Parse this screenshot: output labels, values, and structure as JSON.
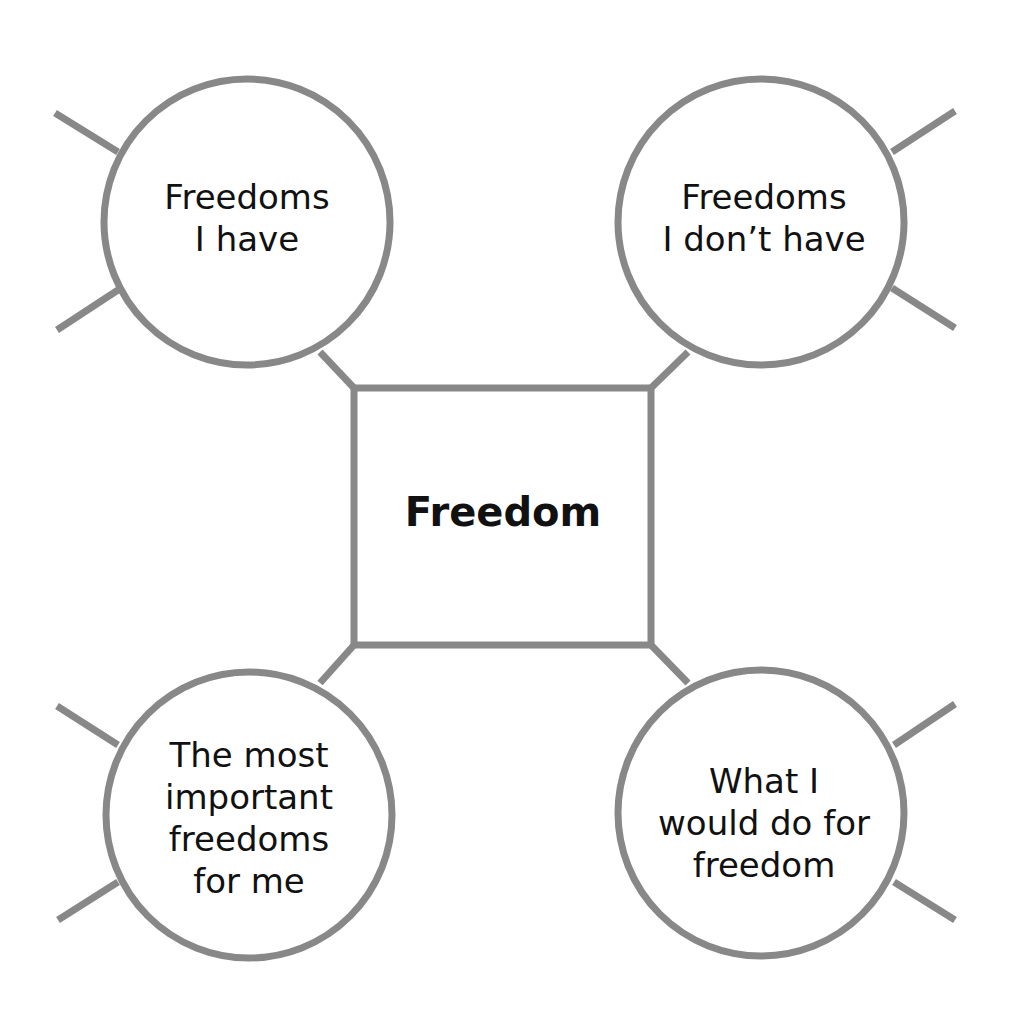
{
  "diagram": {
    "center": {
      "label": "Freedom"
    },
    "nodes": [
      {
        "id": "top-left",
        "label": "Freedoms\nI have"
      },
      {
        "id": "top-right",
        "label": "Freedoms\nI don’t have"
      },
      {
        "id": "bottom-left",
        "label": "The most\nimportant\nfreedoms\nfor me"
      },
      {
        "id": "bottom-right",
        "label": "What I\nwould do for\nfreedom"
      }
    ],
    "colors": {
      "stroke": "#888888",
      "text": "#111111",
      "background": "#ffffff"
    }
  }
}
